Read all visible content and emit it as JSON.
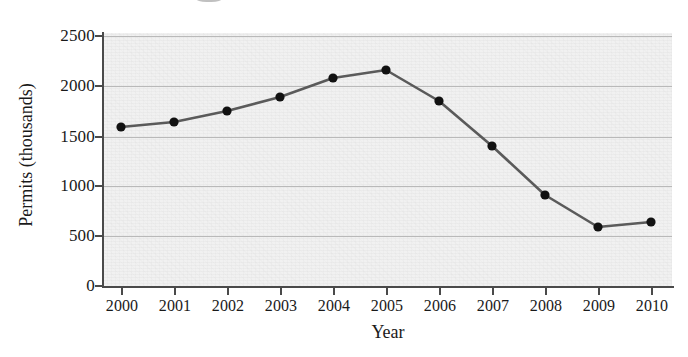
{
  "chart_data": {
    "type": "line",
    "title": "",
    "xlabel": "Year",
    "ylabel": "Permits (thousands)",
    "categories": [
      "2000",
      "2001",
      "2002",
      "2003",
      "2004",
      "2005",
      "2006",
      "2007",
      "2008",
      "2009",
      "2010"
    ],
    "x": [
      2000,
      2001,
      2002,
      2003,
      2004,
      2005,
      2006,
      2007,
      2008,
      2009,
      2010
    ],
    "values": [
      1590,
      1640,
      1750,
      1890,
      2080,
      2160,
      1850,
      1400,
      910,
      590,
      640
    ],
    "series": [
      {
        "name": "Permits",
        "values": [
          1590,
          1640,
          1750,
          1890,
          2080,
          2160,
          1850,
          1400,
          910,
          590,
          640
        ]
      }
    ],
    "ylim": [
      0,
      2500
    ],
    "xlim": [
      2000,
      2010
    ],
    "yticks": [
      0,
      500,
      1000,
      1500,
      2000,
      2500
    ],
    "ytick_labels": [
      "0",
      "500",
      "1000",
      "1500",
      "2000",
      "2500"
    ],
    "xtick_labels": [
      "2000",
      "2001",
      "2002",
      "2003",
      "2004",
      "2005",
      "2006",
      "2007",
      "2008",
      "2009",
      "2010"
    ],
    "grid": true,
    "grid_axis": "y",
    "legend": false,
    "legend_position": "none",
    "marker": "circle",
    "colors": {
      "line": "#5a5a5a",
      "marker": "#111111",
      "gridline": "#b9b9b9",
      "axis": "#4a4a4a",
      "plot_background": "#f1f1f1",
      "page_background": "#ffffff",
      "text": "#1a1a1a"
    }
  },
  "axes": {
    "y_title": "Permits (thousands)",
    "x_title": "Year"
  }
}
